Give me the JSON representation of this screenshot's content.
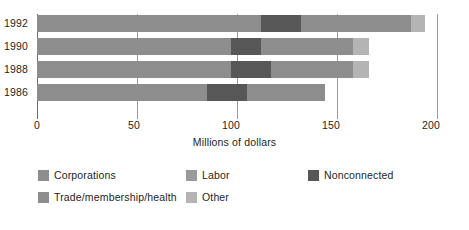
{
  "chart_data": {
    "type": "bar",
    "orientation": "horizontal",
    "stacked": true,
    "title": "",
    "xlabel": "Millions of dollars",
    "ylabel": "",
    "xlim": [
      0,
      200
    ],
    "xticks": [
      0,
      50,
      100,
      150,
      200
    ],
    "xtick_labels": [
      "0",
      "50",
      "100",
      "150",
      "200"
    ],
    "grid": true,
    "grid_axis": "x",
    "legend_position": "bottom-left",
    "categories": [
      "1992",
      "1990",
      "1988",
      "1986"
    ],
    "series": [
      {
        "name": "Corporations",
        "color": "#8d8d8d",
        "values": [
          112,
          97,
          97,
          85
        ]
      },
      {
        "name": "Nonconnected",
        "color": "#575757",
        "values": [
          20,
          15,
          20,
          20
        ]
      },
      {
        "name": "Trade/membership/health",
        "color": "#8d8d8d",
        "values": [
          55,
          46,
          41,
          39
        ]
      },
      {
        "name": "Other",
        "color": "#b4b4b4",
        "values": [
          7,
          8,
          8,
          0
        ]
      },
      {
        "name": "Labor",
        "color": "#9a9a9a",
        "values": [
          0,
          0,
          0,
          0
        ]
      }
    ],
    "totals": [
      193,
      166,
      166,
      144
    ]
  },
  "axis": {
    "x_title": "Millions of dollars",
    "ticks": [
      {
        "label": "0",
        "value": 0
      },
      {
        "label": "50",
        "value": 50
      },
      {
        "label": "100",
        "value": 100
      },
      {
        "label": "150",
        "value": 150
      },
      {
        "label": "200",
        "value": 200
      }
    ],
    "year_labels": [
      "1992",
      "1990",
      "1988",
      "1986"
    ]
  },
  "legend": {
    "row1": [
      {
        "label": "Corporations",
        "color": "#8d8d8d"
      },
      {
        "label": "Labor",
        "color": "#9a9a9a"
      },
      {
        "label": "Nonconnected",
        "color": "#575757"
      }
    ],
    "row2": [
      {
        "label": "Trade/membership/health",
        "color": "#8d8d8d"
      },
      {
        "label": "Other",
        "color": "#b4b4b4"
      }
    ]
  },
  "colors": {
    "corporations": "#8d8d8d",
    "labor": "#9a9a9a",
    "nonconnected": "#575757",
    "trade": "#8d8d8d",
    "other": "#b4b4b4",
    "gridline": "#9b9b9b",
    "text": "#231f20",
    "background": "#ffffff"
  }
}
